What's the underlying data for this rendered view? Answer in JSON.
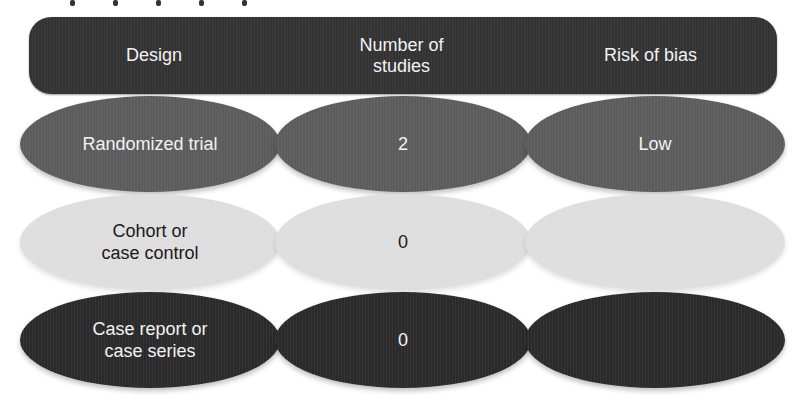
{
  "header": {
    "columns": [
      {
        "label": "Design"
      },
      {
        "label": "Number of\nstudies"
      },
      {
        "label": "Risk of bias"
      }
    ]
  },
  "rows": [
    {
      "design": "Randomized trial",
      "number_of_studies": "2",
      "risk_of_bias": "Low",
      "fill": "#5c5c5c"
    },
    {
      "design": "Cohort or\ncase control",
      "number_of_studies": "0",
      "risk_of_bias": "",
      "fill": "#dedede"
    },
    {
      "design": "Case report or\ncase series",
      "number_of_studies": "0",
      "risk_of_bias": "",
      "fill": "#2a2a2a"
    }
  ],
  "colors": {
    "header_bar": "#333333",
    "header_text": "#f2f2f2",
    "background": "#ffffff"
  }
}
